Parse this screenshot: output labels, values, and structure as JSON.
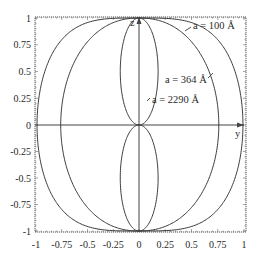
{
  "chart_data": {
    "type": "line",
    "title": "",
    "xlabel": "y",
    "ylabel": "z",
    "xlim": [
      -1,
      1
    ],
    "ylim": [
      -1,
      1
    ],
    "grid": false,
    "xticks": [
      "-1",
      "-0.75",
      "-0.5",
      "-0.25",
      "0",
      "0.25",
      "0.5",
      "0.75",
      "1"
    ],
    "yticks": [
      "-1",
      "-0.75",
      "-0.5",
      "-0.25",
      "0",
      "0.25",
      "0.5",
      "0.75",
      "1"
    ],
    "axis_labels": {
      "horizontal": "y",
      "vertical": "z"
    },
    "series": [
      {
        "name": "a = 100 Å",
        "shape": "closed curve through (0,±1)",
        "max_half_width": 0.99,
        "label_pos": [
          0.48,
          0.93
        ]
      },
      {
        "name": "a = 364 Å",
        "shape": "closed curve through (0,±1)",
        "max_half_width": 0.76,
        "label_pos": [
          0.2,
          0.43
        ]
      },
      {
        "name": "a = 2290 Å",
        "shape": "figure-eight lobes through origin",
        "max_half_width": 0.14,
        "label_pos": [
          0.05,
          0.25
        ]
      }
    ],
    "legend": "inline annotations with leader lines"
  },
  "labels": {
    "a100": "a = 100 Å",
    "a364": "a = 364 Å",
    "a2290": "a = 2290 Å",
    "axis_y": "y",
    "axis_z": "z"
  },
  "colors": {
    "line": "#3a3a3a",
    "frame": "#555555",
    "background": "#ffffff"
  }
}
